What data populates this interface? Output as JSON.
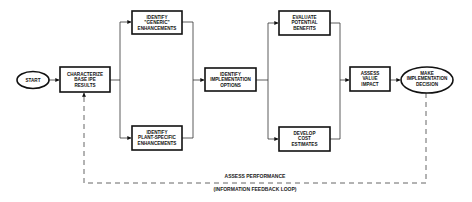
{
  "diagram": {
    "nodes": {
      "start": {
        "lines": [
          "START"
        ]
      },
      "characterize": {
        "lines": [
          "CHARACTERIZE",
          "BASE IPE",
          "RESULTS"
        ]
      },
      "generic": {
        "lines": [
          "IDENTIFY",
          "\"GENERIC\"",
          "ENHANCEMENTS"
        ]
      },
      "plant_specific": {
        "lines": [
          "IDENTIFY",
          "PLANT-SPECIFIC",
          "ENHANCEMENTS"
        ]
      },
      "options": {
        "lines": [
          "IDENTIFY",
          "IMPLEMENTATION",
          "OPTIONS"
        ]
      },
      "evaluate": {
        "lines": [
          "EVALUATE",
          "POTENTIAL",
          "BENEFITS"
        ]
      },
      "cost": {
        "lines": [
          "DEVELOP",
          "COST",
          "ESTIMATES"
        ]
      },
      "assess_value": {
        "lines": [
          "ASSESS",
          "VALUE",
          "IMPACT"
        ]
      },
      "decision": {
        "lines": [
          "MAKE",
          "IMPLEMENTATION",
          "DECISION"
        ]
      }
    },
    "feedback": {
      "label": "ASSESS PERFORMANCE",
      "sublabel": "(INFORMATION FEEDBACK LOOP)"
    },
    "colors": {
      "stroke": "#111111",
      "background": "#ffffff"
    }
  }
}
